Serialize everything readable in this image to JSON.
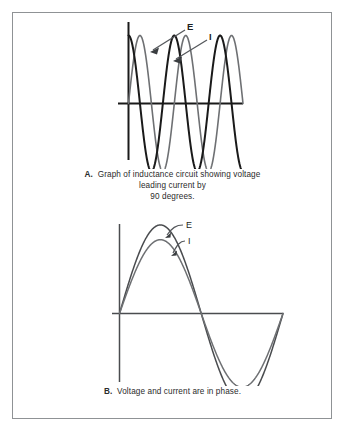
{
  "figure": {
    "border_color": "#8f9295",
    "background": "#ffffff",
    "panels": [
      {
        "id": "A",
        "caption_lead": "A.",
        "caption_lines": [
          "Graph of inductance circuit showing voltage",
          "leading current by",
          "90 degrees."
        ],
        "caption_full": "A. Graph of inductance circuit showing voltage leading current by 90 degrees.",
        "labels": [
          {
            "name": "voltage",
            "text": "E"
          },
          {
            "name": "current",
            "text": "I"
          }
        ]
      },
      {
        "id": "B",
        "caption_lead": "B.",
        "caption_lines": [
          "Voltage and current are in phase."
        ],
        "caption_full": "B. Voltage and current are in phase.",
        "labels": [
          {
            "name": "voltage",
            "text": "E"
          },
          {
            "name": "current",
            "text": "I"
          }
        ]
      }
    ]
  },
  "chart_data": [
    {
      "type": "line",
      "id": "panel-a",
      "title": "Graph of inductance circuit showing voltage leading current by 90 degrees.",
      "xlabel": "",
      "ylabel": "",
      "grid": false,
      "legend": "inline-annotations",
      "axes": {
        "x_axis_drawn": true,
        "y_axis_drawn": true,
        "x_range_deg": [
          0,
          900
        ],
        "y_range": [
          -1,
          1
        ]
      },
      "annotations": [
        {
          "text": "E",
          "points_to": "voltage-wave",
          "arrow": true
        },
        {
          "text": "I",
          "points_to": "current-wave",
          "arrow": true
        }
      ],
      "series": [
        {
          "name": "E",
          "label": "Voltage",
          "color": "#1a1a1a",
          "phase_deg": 90,
          "amplitude": 1.0,
          "cycles": 2.5,
          "formula": "sin(x + 90deg)",
          "x_deg": [
            0,
            45,
            90,
            135,
            180,
            225,
            270,
            315,
            360,
            405,
            450,
            495,
            540,
            585,
            630,
            675,
            720,
            765,
            810,
            855,
            900
          ],
          "values": [
            1.0,
            0.71,
            0.0,
            -0.71,
            -1.0,
            -0.71,
            0.0,
            0.71,
            1.0,
            0.71,
            0.0,
            -0.71,
            -1.0,
            -0.71,
            0.0,
            0.71,
            1.0,
            0.71,
            0.0,
            -0.71,
            -1.0
          ]
        },
        {
          "name": "I",
          "label": "Current",
          "color": "#6e7073",
          "phase_deg": 0,
          "amplitude": 1.0,
          "cycles": 2.5,
          "formula": "sin(x)",
          "x_deg": [
            0,
            45,
            90,
            135,
            180,
            225,
            270,
            315,
            360,
            405,
            450,
            495,
            540,
            585,
            630,
            675,
            720,
            765,
            810,
            855,
            900
          ],
          "values": [
            0.0,
            0.71,
            1.0,
            0.71,
            0.0,
            -0.71,
            -1.0,
            -0.71,
            0.0,
            0.71,
            1.0,
            0.71,
            0.0,
            -0.71,
            -1.0,
            -0.71,
            0.0,
            0.71,
            1.0,
            0.71,
            0.0
          ]
        }
      ],
      "phase_relationship": "E leads I by 90 degrees"
    },
    {
      "type": "line",
      "id": "panel-b",
      "title": "Voltage and current are in phase.",
      "xlabel": "",
      "ylabel": "",
      "grid": false,
      "legend": "inline-annotations",
      "axes": {
        "x_axis_drawn": true,
        "y_axis_drawn": true,
        "x_range_deg": [
          0,
          360
        ],
        "y_range": [
          -1.08,
          1.08
        ]
      },
      "annotations": [
        {
          "text": "E",
          "points_to": "voltage-wave",
          "arrow": true
        },
        {
          "text": "I",
          "points_to": "current-wave",
          "arrow": true
        }
      ],
      "series": [
        {
          "name": "E",
          "label": "Voltage",
          "color": "#4a4c4f",
          "phase_deg": 0,
          "amplitude": 1.08,
          "cycles": 1,
          "formula": "1.08 * sin(x)",
          "x_deg": [
            0,
            45,
            90,
            135,
            180,
            225,
            270,
            315,
            360
          ],
          "values": [
            0.0,
            0.76,
            1.08,
            0.76,
            0.0,
            -0.76,
            -1.08,
            -0.76,
            0.0
          ]
        },
        {
          "name": "I",
          "label": "Current",
          "color": "#6e7073",
          "phase_deg": 0,
          "amplitude": 0.9,
          "cycles": 1,
          "formula": "0.9 * sin(x)",
          "x_deg": [
            0,
            45,
            90,
            135,
            180,
            225,
            270,
            315,
            360
          ],
          "values": [
            0.0,
            0.64,
            0.9,
            0.64,
            0.0,
            -0.64,
            -0.9,
            -0.64,
            0.0
          ]
        }
      ],
      "phase_relationship": "E and I are in phase"
    }
  ]
}
